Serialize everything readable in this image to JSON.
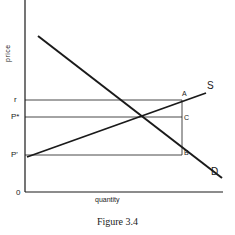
{
  "figure": {
    "caption": "Figure 3.4",
    "x_axis_label": "quantity",
    "y_axis_label": "price",
    "origin_label": "0",
    "price_labels": {
      "r": "r",
      "p_star": "P*",
      "p_prime": "P'"
    },
    "point_labels": {
      "A": "A",
      "B": "B",
      "C": "C"
    },
    "curve_labels": {
      "supply": "S",
      "demand": "D"
    },
    "line_color": "#1a1a1a"
  }
}
